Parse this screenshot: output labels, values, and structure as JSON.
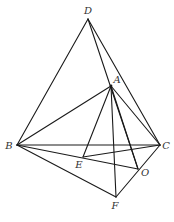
{
  "figure": {
    "type": "geometry-diagram",
    "colors": {
      "line": "#1a1a1a",
      "label": "#333333",
      "background": "#ffffff"
    },
    "points": [
      {
        "id": "D",
        "x": 88,
        "y": 19,
        "label": "D",
        "lx": 88,
        "ly": 14
      },
      {
        "id": "A",
        "x": 111,
        "y": 86,
        "label": "A",
        "lx": 117,
        "ly": 83
      },
      {
        "id": "B",
        "x": 17,
        "y": 145,
        "label": "B",
        "lx": 9,
        "ly": 149
      },
      {
        "id": "C",
        "x": 160,
        "y": 145,
        "label": "C",
        "lx": 166,
        "ly": 149
      },
      {
        "id": "E",
        "x": 83,
        "y": 157,
        "label": "E",
        "lx": 79,
        "ly": 168
      },
      {
        "id": "O",
        "x": 138,
        "y": 169,
        "label": "O",
        "lx": 145,
        "ly": 176
      },
      {
        "id": "F",
        "x": 116,
        "y": 197,
        "label": "F",
        "lx": 115,
        "ly": 209
      }
    ],
    "segments": [
      [
        "D",
        "B"
      ],
      [
        "D",
        "C"
      ],
      [
        "D",
        "O"
      ],
      [
        "A",
        "B"
      ],
      [
        "A",
        "C"
      ],
      [
        "A",
        "E"
      ],
      [
        "A",
        "F"
      ],
      [
        "A",
        "O"
      ],
      [
        "B",
        "C"
      ],
      [
        "B",
        "O"
      ],
      [
        "B",
        "F"
      ],
      [
        "E",
        "C"
      ],
      [
        "C",
        "F"
      ]
    ],
    "labels": {
      "D": "D",
      "A": "A",
      "B": "B",
      "C": "C",
      "E": "E",
      "O": "O",
      "F": "F"
    }
  }
}
